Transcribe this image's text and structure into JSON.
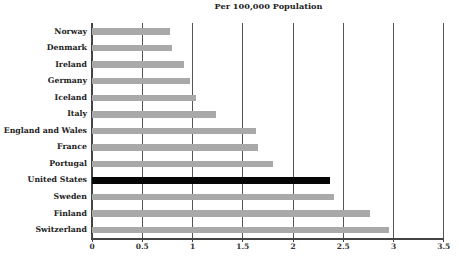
{
  "chart_data": {
    "type": "bar",
    "orientation": "horizontal",
    "title": "",
    "subtitle": "Per 100,000 Population",
    "xlabel": "",
    "ylabel": "",
    "xlim": [
      0,
      3.5
    ],
    "xticks": [
      "0",
      "0.5",
      "1",
      "1.5",
      "2",
      "2.5",
      "3",
      "3.5"
    ],
    "grid": "vertical",
    "legend": "none",
    "categories": [
      "Norway",
      "Denmark",
      "Ireland",
      "Germany",
      "Iceland",
      "Italy",
      "England and Wales",
      "France",
      "Portugal",
      "United States",
      "Sweden",
      "Finland",
      "Switzerland"
    ],
    "values": [
      0.78,
      0.8,
      0.92,
      0.98,
      1.03,
      1.23,
      1.63,
      1.65,
      1.8,
      2.37,
      2.41,
      2.77,
      2.96
    ],
    "highlight": "United States",
    "colors": {
      "default": "#a9a9a9",
      "highlight": "#050505"
    }
  }
}
